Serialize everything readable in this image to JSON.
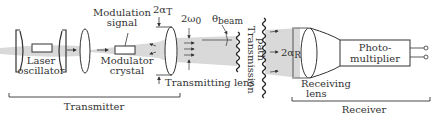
{
  "diagram": {
    "type": "optical communication system block diagram",
    "components": {
      "laser_oscillator": "Laser\noscillator",
      "modulation_signal": "Modulation\nsignal",
      "modulator_crystal": "Modulator\ncrystal",
      "transmitting_lens": "Transmitting lens",
      "transmission_path": "Transmission\npath",
      "receiving_lens": "Receiving\nlens",
      "photomultiplier": "Photo-\nmultiplier"
    },
    "symbols": {
      "alpha_T": "2αT",
      "omega_0": "2ω0",
      "theta_beam": "θbeam",
      "alpha_R": "2αR"
    },
    "groups": {
      "transmitter": "Transmitter",
      "receiver": "Receiver"
    }
  }
}
